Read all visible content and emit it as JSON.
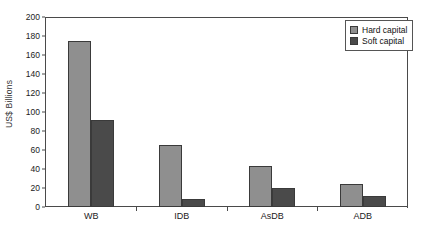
{
  "chart_data": {
    "type": "bar",
    "title": "",
    "xlabel": "",
    "ylabel": "US$ Billions",
    "ylim": [
      0,
      200
    ],
    "yticks": [
      0,
      20,
      40,
      60,
      80,
      100,
      120,
      140,
      160,
      180,
      200
    ],
    "grid": false,
    "legend_position": "top-right",
    "categories": [
      "WB",
      "IDB",
      "AsDB",
      "ADB"
    ],
    "series": [
      {
        "name": "Hard capital",
        "color": "#8f8f8f",
        "values": [
          175,
          65,
          43,
          24
        ]
      },
      {
        "name": "Soft capital",
        "color": "#4a4a4a",
        "values": [
          92,
          8,
          20,
          12
        ]
      }
    ]
  },
  "legend": {
    "items": [
      {
        "label": "Hard capital"
      },
      {
        "label": "Soft capital"
      }
    ]
  },
  "axis": {
    "y_title": "US$ Billions",
    "tick_labels": [
      "200",
      "180",
      "160",
      "140",
      "120",
      "100",
      "80",
      "60",
      "40",
      "20",
      "0"
    ]
  }
}
